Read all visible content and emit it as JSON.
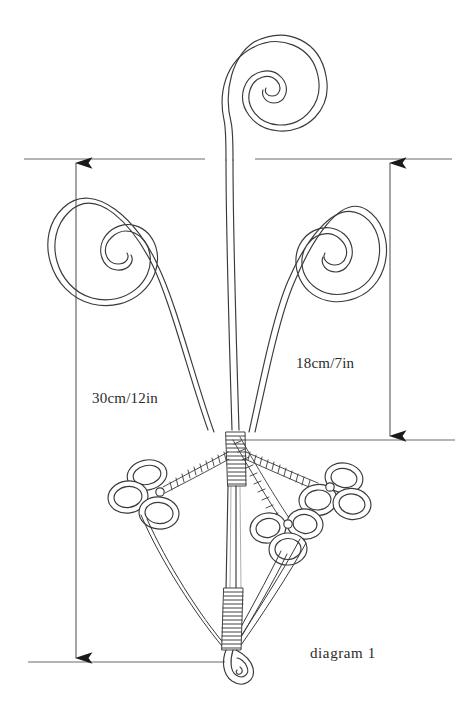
{
  "figure": {
    "title": "diagram 1",
    "background_color": "#ffffff",
    "ink_color": "#2b2b2b",
    "line_color": "#555555"
  },
  "dimensions": [
    {
      "id": "height-total",
      "label": "30cm/12in",
      "side": "left",
      "from_y": 159,
      "to_y": 662,
      "axis_x": 76,
      "arrow_top": "up",
      "arrow_bottom": "down"
    },
    {
      "id": "height-spread",
      "label": "18cm/7in",
      "side": "right",
      "from_y": 159,
      "to_y": 440,
      "axis_x": 390,
      "arrow_top": "up",
      "arrow_bottom": "down"
    }
  ],
  "extension_lines": [
    {
      "id": "top-left-extension",
      "x1": 24,
      "x2": 205,
      "y": 159
    },
    {
      "id": "top-right-extension",
      "x1": 255,
      "x2": 452,
      "y": 159
    },
    {
      "id": "mid-right-extension",
      "x1": 245,
      "x2": 455,
      "y": 440
    },
    {
      "id": "bottom-extension",
      "x1": 28,
      "x2": 225,
      "y": 662
    }
  ],
  "elements": {
    "top_spiral": {
      "name": "top-spiral",
      "center_x": 239,
      "center_y": 88,
      "turns": 2.6
    },
    "left_spiral": {
      "name": "left-spiral",
      "center_x": 137,
      "center_y": 243,
      "turns": 2.6
    },
    "right_spiral": {
      "name": "right-spiral",
      "center_x": 333,
      "center_y": 242,
      "turns": 2.4
    },
    "binding_collar": {
      "name": "wrapped-collar",
      "center_x": 236,
      "center_y": 455
    },
    "lower_binding": {
      "name": "lower-wrapped-collar",
      "center_x": 231,
      "center_y": 600
    },
    "bottom_loop": {
      "name": "closed-end-loop",
      "center_x": 233,
      "center_y": 676
    },
    "ring_clusters": [
      {
        "name": "left-ring-cluster",
        "ring_count": 3,
        "center_x": 146,
        "center_y": 495
      },
      {
        "name": "right-upper-ring-cluster",
        "ring_count": 3,
        "center_x": 340,
        "center_y": 495
      },
      {
        "name": "right-lower-ring-cluster",
        "ring_count": 3,
        "center_x": 285,
        "center_y": 540
      }
    ]
  }
}
